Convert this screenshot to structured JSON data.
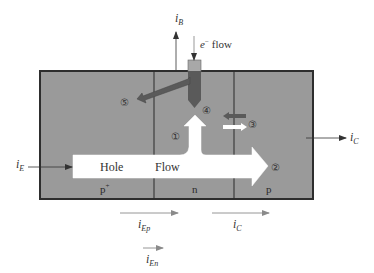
{
  "diagram": {
    "type": "pnp-bjt-current-flow",
    "colors": {
      "semiconductor_fill": "#9a9a9a",
      "border": "#333333",
      "hole_arrow": "#ffffff",
      "electron_arrow": "#5a5a5a",
      "contact_top": "#a8a8a8",
      "current_arrow": "#444444",
      "faded_current_arrow": "#8a8a8a"
    },
    "regions": [
      {
        "id": "emitter",
        "label": "p",
        "superscript": "+"
      },
      {
        "id": "base",
        "label": "n"
      },
      {
        "id": "collector",
        "label": "p"
      }
    ],
    "hole_flow": {
      "word1": "Hole",
      "word2": "Flow"
    },
    "markers": [
      "①",
      "②",
      "③",
      "④",
      "⑤"
    ],
    "terminal_currents": {
      "base": {
        "symbol": "i",
        "sub": "B"
      },
      "emitter": {
        "symbol": "i",
        "sub": "E"
      },
      "collector": {
        "symbol": "i",
        "sub": "C"
      }
    },
    "electron_flow_label": {
      "symbol": "e",
      "sup": "−",
      "text": "flow"
    },
    "component_currents": [
      {
        "symbol": "i",
        "sub": "Ep"
      },
      {
        "symbol": "i",
        "sub": "C"
      },
      {
        "symbol": "i",
        "sub": "En"
      }
    ]
  }
}
